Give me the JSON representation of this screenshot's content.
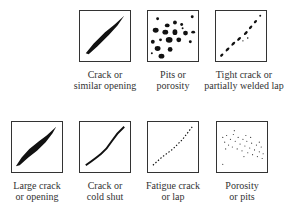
{
  "figure": {
    "top_row": [
      {
        "id": "crack",
        "line1": "Crack or",
        "line2": "similar opening"
      },
      {
        "id": "pits",
        "line1": "Pits or",
        "line2": "porosity"
      },
      {
        "id": "tight-crack",
        "line1": "Tight crack or",
        "line2": "partially welded lap"
      }
    ],
    "bottom_row": [
      {
        "id": "large-crack",
        "line1": "Large crack",
        "line2": "or opening"
      },
      {
        "id": "cold-shut",
        "line1": "Crack or",
        "line2": "cold shut"
      },
      {
        "id": "fatigue",
        "line1": "Fatigue crack",
        "line2": "or lap"
      },
      {
        "id": "porosity",
        "line1": "Porosity",
        "line2": "or pits"
      }
    ]
  }
}
